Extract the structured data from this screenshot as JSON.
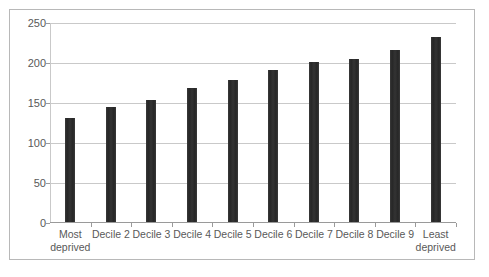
{
  "chart_data": {
    "type": "bar",
    "title": "",
    "subtitle": "",
    "xlabel": "",
    "ylabel": "",
    "categories": [
      "Most deprived",
      "Decile 2",
      "Decile 3",
      "Decile 4",
      "Decile 5",
      "Decile 6",
      "Decile 7",
      "Decile 8",
      "Decile 9",
      "Least deprived"
    ],
    "values": [
      131,
      145,
      154,
      169,
      179,
      191,
      201,
      205,
      216,
      232
    ],
    "ylim": [
      0,
      250
    ],
    "yticks": [
      0,
      50,
      100,
      150,
      200,
      250
    ],
    "ytick_labels": [
      "0",
      "50",
      "100",
      "150",
      "200",
      "250"
    ],
    "grid": true,
    "legend": false,
    "legend_position": "none",
    "bar_color": "#2d2d2d",
    "gridline_color": "#c9c9c9",
    "axis_color": "#9a9a9a",
    "tick_label_color": "#595959",
    "border_color": "#b8b8b8",
    "background_color": "#ffffff"
  }
}
